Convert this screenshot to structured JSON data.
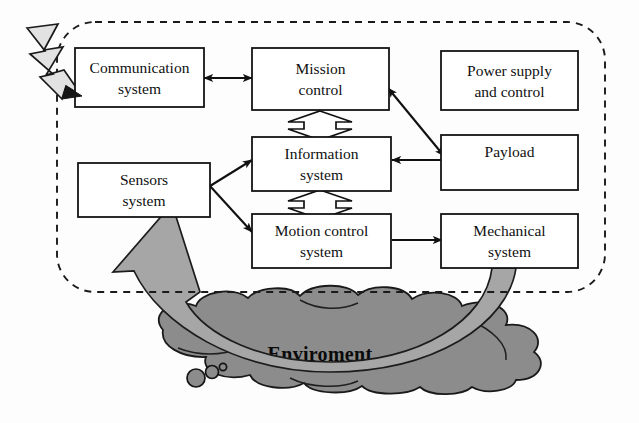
{
  "figure": {
    "title": "Enviroment",
    "boundary_name": "system-boundary"
  },
  "nodes": [
    {
      "id": "communication",
      "line1": "Communication",
      "line2": "system"
    },
    {
      "id": "mission_control",
      "line1": "Mission",
      "line2": "control"
    },
    {
      "id": "power_supply",
      "line1": "Power supply",
      "line2": "and control"
    },
    {
      "id": "sensors",
      "line1": "Sensors",
      "line2": "system"
    },
    {
      "id": "information",
      "line1": "Information",
      "line2": "system"
    },
    {
      "id": "payload",
      "line1": "Payload",
      "line2": ""
    },
    {
      "id": "motion_control",
      "line1": "Motion control",
      "line2": "system"
    },
    {
      "id": "mechanical",
      "line1": "Mechanical",
      "line2": "system"
    }
  ],
  "environment": {
    "label": "Enviroment"
  },
  "connectors": [
    {
      "from": "communication",
      "to": "mission_control",
      "style": "solid-double"
    },
    {
      "from": "mission_control",
      "to": "information",
      "style": "hollow-double"
    },
    {
      "from": "information",
      "to": "motion_control",
      "style": "hollow-double"
    },
    {
      "from": "sensors",
      "to": "information",
      "style": "solid-single"
    },
    {
      "from": "sensors",
      "to": "motion_control",
      "style": "solid-single"
    },
    {
      "from": "payload",
      "to": "information",
      "style": "solid-single"
    },
    {
      "from": "mission_control",
      "to": "payload",
      "style": "solid-double"
    },
    {
      "from": "motion_control",
      "to": "mechanical",
      "style": "solid-single"
    },
    {
      "from": "mechanical",
      "to": "sensors",
      "style": "gray-feedback-band"
    },
    {
      "from": "environment",
      "to": "communication",
      "style": "lightning-bolt"
    }
  ],
  "colors": {
    "cloud_fill": "#8c8c8c",
    "band_fill": "#a6a6a6",
    "bolt_fill": "#e2e2e2",
    "box_stroke": "#141414",
    "box_fill": "#ffffff",
    "text": "#101010"
  },
  "icons": {
    "lightning": "lightning-bolt-icon",
    "cloud": "cloud-icon",
    "bubbles": "bubbles-icon"
  }
}
